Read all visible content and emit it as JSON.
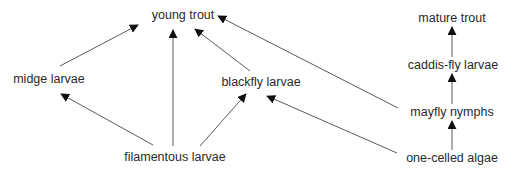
{
  "colors": {
    "text": "#2a2a2a",
    "line": "#555555",
    "arrow": "#111111",
    "background": "#ffffff"
  },
  "nodes": {
    "young_trout": {
      "label": "young trout",
      "x": 183,
      "y": 15
    },
    "mature_trout": {
      "label": "mature trout",
      "x": 452,
      "y": 18
    },
    "caddis_fly_larvae": {
      "label": "caddis-fly larvae",
      "x": 453,
      "y": 65
    },
    "midge_larvae": {
      "label": "midge larvae",
      "x": 49,
      "y": 79
    },
    "blackfly_larvae": {
      "label": "blackfly larvae",
      "x": 261,
      "y": 82
    },
    "mayfly_nymphs": {
      "label": "mayfly nymphs",
      "x": 452,
      "y": 112
    },
    "filamentous_larvae": {
      "label": "filamentous larvae",
      "x": 175,
      "y": 157
    },
    "one_celled_algae": {
      "label": "one-celled algae",
      "x": 452,
      "y": 158
    }
  },
  "edges": [
    {
      "from": "midge larvae",
      "to": "young trout"
    },
    {
      "from": "filamentous larvae",
      "to": "young trout"
    },
    {
      "from": "blackfly larvae",
      "to": "young trout"
    },
    {
      "from": "mayfly nymphs",
      "to": "young trout"
    },
    {
      "from": "filamentous larvae",
      "to": "midge larvae"
    },
    {
      "from": "filamentous larvae",
      "to": "blackfly larvae"
    },
    {
      "from": "one-celled algae",
      "to": "blackfly larvae"
    },
    {
      "from": "one-celled algae",
      "to": "mayfly nymphs"
    },
    {
      "from": "mayfly nymphs",
      "to": "caddis-fly larvae"
    },
    {
      "from": "caddis-fly larvae",
      "to": "mature trout"
    }
  ]
}
